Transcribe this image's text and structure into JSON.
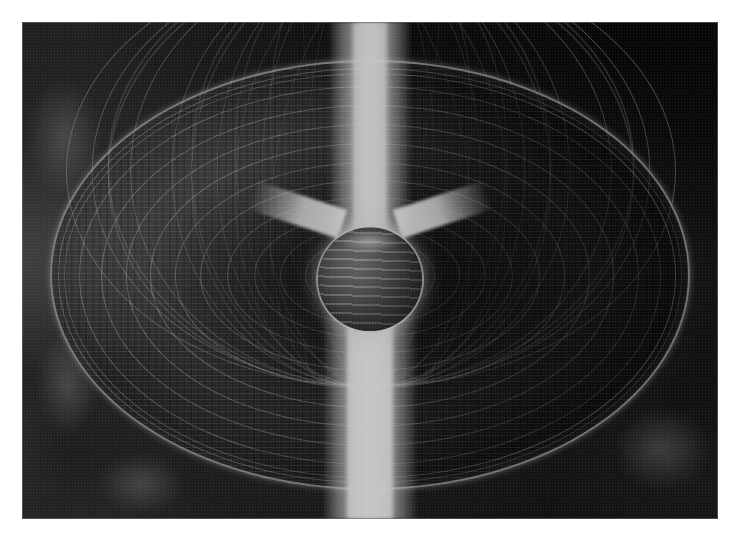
{
  "figure": {
    "domain": "scientific-visualization",
    "medium": "halftone-printed grayscale photographic plate",
    "palette": {
      "paper": "#ffffff",
      "background_dark": "#1b1b1b",
      "background_mid": "#3a3a3a",
      "mesh_line": "#d7d7d7",
      "jet_bright": "#ffffff",
      "sphere_mid": "#5f5f5f",
      "rim_highlight": "#e4e4e4"
    },
    "plate": {
      "left": 22,
      "top": 22,
      "width": 696,
      "height": 497
    },
    "elements": {
      "disc_label": "wireframe accretion disc",
      "sphere_label": "central sphere",
      "jet_top_label": "upper polar jet",
      "jet_bottom_label": "lower polar jet",
      "funnel_label": "central funnel",
      "background_label": "mottled nebular background"
    },
    "mesh": {
      "latitude_ring_count": 13,
      "meridian_count": 18,
      "disc_width": 640,
      "disc_height": 430
    },
    "caption": ""
  }
}
